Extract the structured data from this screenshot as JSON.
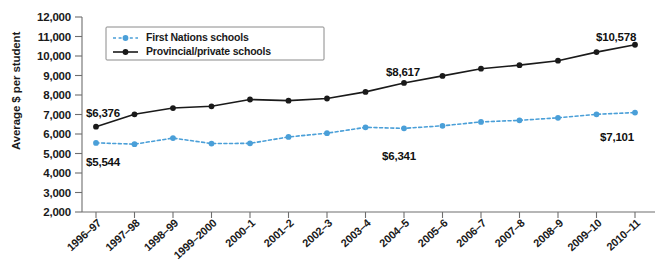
{
  "chart_data": {
    "type": "line",
    "title": "",
    "xlabel": "",
    "ylabel": "Average $ per student",
    "ylim": [
      2000,
      12000
    ],
    "ytick_step": 1000,
    "grid": false,
    "legend_position": "top-left",
    "categories": [
      "1996–97",
      "1997–98",
      "1998–99",
      "1999–2000",
      "2000–1",
      "2001–2",
      "2002–3",
      "2003–4",
      "2004–5",
      "2005–6",
      "2006–7",
      "2007–8",
      "2008–9",
      "2009–10",
      "2010–11"
    ],
    "yticks": [
      "2,000",
      "3,000",
      "4,000",
      "5,000",
      "6,000",
      "7,000",
      "8,000",
      "9,000",
      "10,000",
      "11,000",
      "12,000"
    ],
    "series": [
      {
        "name": "First Nations schools",
        "color": "#4a9fd8",
        "style": "dashed",
        "values": [
          5544,
          5480,
          5790,
          5510,
          5520,
          5850,
          6040,
          6341,
          6290,
          6420,
          6620,
          6700,
          6830,
          7010,
          7101
        ]
      },
      {
        "name": "Provincial/private schools",
        "color": "#1a1a1a",
        "style": "solid",
        "values": [
          6376,
          7010,
          7330,
          7420,
          7770,
          7710,
          7820,
          8160,
          8617,
          8980,
          9350,
          9530,
          9760,
          10200,
          10578
        ]
      }
    ],
    "annotations": [
      {
        "label": "$6,376",
        "series": "Provincial/private schools",
        "category": "1996–97",
        "x": 86,
        "y": 117,
        "anchor": "start"
      },
      {
        "label": "$5,544",
        "series": "First Nations schools",
        "category": "1996–97",
        "x": 86,
        "y": 166,
        "anchor": "start"
      },
      {
        "label": "$8,617",
        "series": "Provincial/private schools",
        "category": "2004–5",
        "x": 386,
        "y": 76,
        "anchor": "start"
      },
      {
        "label": "$6,341",
        "series": "First Nations schools",
        "category": "2003–4",
        "x": 382,
        "y": 160,
        "anchor": "start"
      },
      {
        "label": "$10,578",
        "series": "Provincial/private schools",
        "category": "2010–11",
        "x": 596,
        "y": 41,
        "anchor": "start"
      },
      {
        "label": "$7,101",
        "series": "First Nations schools",
        "category": "2010–11",
        "x": 600,
        "y": 141,
        "anchor": "start"
      }
    ]
  }
}
